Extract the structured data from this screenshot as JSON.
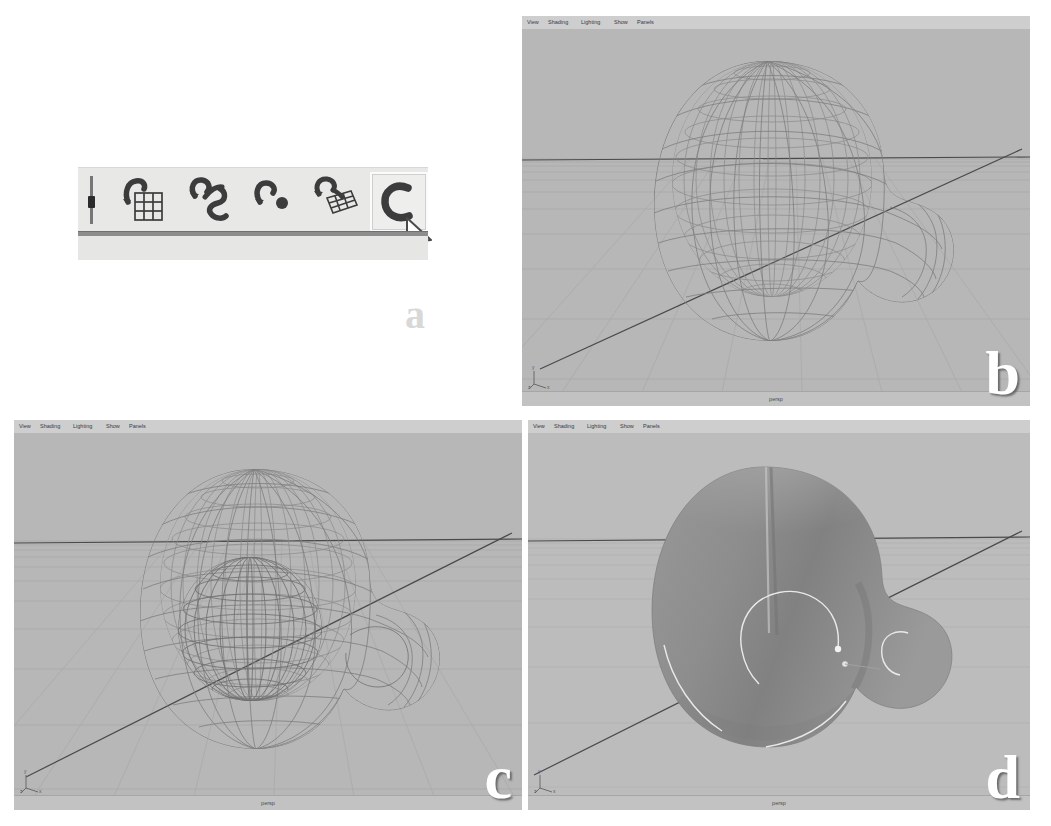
{
  "figure": {
    "background_color": "#ffffff",
    "panel_labels": [
      "a",
      "b",
      "c",
      "d"
    ]
  },
  "panel_a": {
    "name": "modeling-toolbar-shelf",
    "label": "a",
    "shelf_background": "#e8e8e6",
    "selected_index": 4,
    "cursor": "arrow-pointer",
    "tools": [
      {
        "id": "tool-attach-surfaces",
        "icon": "curve-on-grid-icon",
        "label": "Attach Surfaces",
        "selected": false
      },
      {
        "id": "tool-loft",
        "icon": "two-curves-icon",
        "label": "Loft",
        "selected": false
      },
      {
        "id": "tool-curve-point",
        "icon": "curve-with-point-icon",
        "label": "Curve Point",
        "selected": false
      },
      {
        "id": "tool-birail",
        "icon": "curve-on-mesh-icon",
        "label": "Birail",
        "selected": false
      },
      {
        "id": "tool-revolve",
        "icon": "open-curve-icon",
        "label": "Revolve",
        "selected": true
      }
    ]
  },
  "panel_b": {
    "name": "maya-viewport-wireframe-b",
    "label": "b",
    "menu_items": [
      "View",
      "Shading",
      "Lighting",
      "Show",
      "Panels"
    ],
    "camera_label": "persp",
    "axis_labels": [
      "y",
      "z",
      "x"
    ],
    "display_mode": "wireframe",
    "background_color": "#b7b7b7",
    "wire_color": "#7d7d7d"
  },
  "panel_c": {
    "name": "maya-viewport-wireframe-c",
    "label": "c",
    "menu_items": [
      "View",
      "Shading",
      "Lighting",
      "Show",
      "Panels"
    ],
    "camera_label": "persp",
    "axis_labels": [
      "y",
      "z",
      "x"
    ],
    "display_mode": "wireframe",
    "background_color": "#b7b7b7",
    "wire_color": "#7d7d7d"
  },
  "panel_d": {
    "name": "maya-viewport-shaded-d",
    "label": "d",
    "menu_items": [
      "View",
      "Shading",
      "Lighting",
      "Show",
      "Panels"
    ],
    "camera_label": "persp",
    "axis_labels": [
      "y",
      "z",
      "x"
    ],
    "display_mode": "smooth-shaded",
    "background_color": "#bcbcbc",
    "surface_color": "#8e8e8e",
    "highlight_curve_color": "#e9e9e9"
  }
}
